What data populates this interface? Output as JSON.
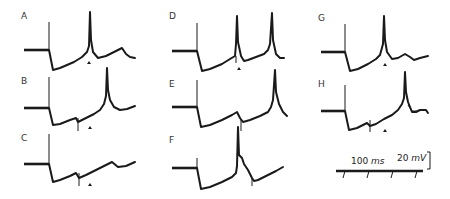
{
  "figure": {
    "panels": [
      {
        "label": "A",
        "has_triangle_marker": true
      },
      {
        "label": "B",
        "has_triangle_marker": true
      },
      {
        "label": "C",
        "has_triangle_marker": true
      },
      {
        "label": "D",
        "has_triangle_marker": true
      },
      {
        "label": "E",
        "has_triangle_marker": false
      },
      {
        "label": "F",
        "has_triangle_marker": false
      },
      {
        "label": "G",
        "has_triangle_marker": true
      },
      {
        "label": "H",
        "has_triangle_marker": true
      }
    ],
    "scale_bar": {
      "voltage_value": "20",
      "voltage_unit": "mV",
      "time_value": "100",
      "time_unit": "ms"
    },
    "colors": {
      "trace": "#1a1a1a",
      "background": "#ffffff"
    }
  }
}
